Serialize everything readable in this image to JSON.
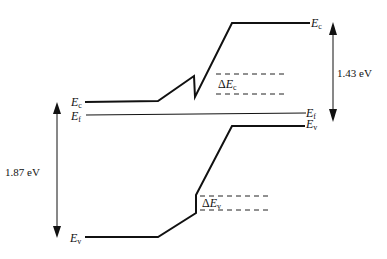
{
  "diagram": {
    "type": "energy-band-diagram",
    "labels": {
      "ec_left": {
        "main": "E",
        "sub": "c"
      },
      "ef_left": {
        "main": "E",
        "sub": "f"
      },
      "ev_left": {
        "main": "E",
        "sub": "v"
      },
      "ec_right": {
        "main": "E",
        "sub": "c"
      },
      "ef_right": {
        "main": "E",
        "sub": "f"
      },
      "ev_right": {
        "main": "E",
        "sub": "v"
      },
      "delta_ec": {
        "delta": "Δ",
        "main": "E",
        "sub": "c"
      },
      "delta_ev": {
        "delta": "Δ",
        "main": "E",
        "sub": "v"
      }
    },
    "gaps": {
      "left_bandgap": "1.87 eV",
      "right_bandgap": "1.43 eV"
    },
    "colors": {
      "line": "#111111",
      "background": "#ffffff"
    }
  }
}
